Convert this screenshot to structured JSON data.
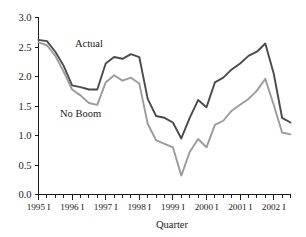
{
  "chart_data": {
    "type": "line",
    "title": "",
    "xlabel": "Quarter",
    "ylabel": "",
    "ylim": [
      0.0,
      3.0
    ],
    "ytick_values": [
      0.0,
      0.5,
      1.0,
      1.5,
      2.0,
      2.5,
      3.0
    ],
    "ytick_labels": [
      "0.0",
      "0.5",
      "1.0",
      "1.5",
      "2.0",
      "2.5",
      "3.0"
    ],
    "xtick_labels": [
      "1995 I",
      "1996 I",
      "1997 I",
      "1998 I",
      "1999 I",
      "2000 I",
      "2001 I",
      "2002 I"
    ],
    "x_minor_ticks_per_year": 4,
    "grid": false,
    "legend_position": "inline-annotation",
    "x": [
      "1995 I",
      "1995 II",
      "1995 III",
      "1995 IV",
      "1996 I",
      "1996 II",
      "1996 III",
      "1996 IV",
      "1997 I",
      "1997 II",
      "1997 III",
      "1997 IV",
      "1998 I",
      "1998 II",
      "1998 III",
      "1998 IV",
      "1999 I",
      "1999 II",
      "1999 III",
      "1999 IV",
      "2000 I",
      "2000 II",
      "2000 III",
      "2000 IV",
      "2001 I",
      "2001 II",
      "2001 III",
      "2001 IV",
      "2002 I",
      "2002 II",
      "2002 III"
    ],
    "series": [
      {
        "name": "Actual",
        "color": "#4a4a4a",
        "values": [
          2.62,
          2.6,
          2.42,
          2.18,
          1.85,
          1.82,
          1.78,
          1.78,
          2.22,
          2.33,
          2.3,
          2.38,
          2.33,
          1.62,
          1.33,
          1.3,
          1.22,
          0.95,
          1.3,
          1.6,
          1.48,
          1.9,
          1.98,
          2.12,
          2.22,
          2.35,
          2.42,
          2.56,
          2.05,
          1.3,
          1.22
        ]
      },
      {
        "name": "No Boom",
        "color": "#9b9b9b",
        "values": [
          2.58,
          2.53,
          2.35,
          2.08,
          1.78,
          1.68,
          1.55,
          1.52,
          1.9,
          2.02,
          1.93,
          1.98,
          1.88,
          1.2,
          0.92,
          0.86,
          0.8,
          0.32,
          0.72,
          0.94,
          0.8,
          1.18,
          1.25,
          1.42,
          1.52,
          1.62,
          1.76,
          1.96,
          1.52,
          1.05,
          1.02
        ]
      }
    ],
    "annotations": [
      {
        "text": "Actual",
        "near_x": "1996 III",
        "near_y": 2.5
      },
      {
        "text": "No Boom",
        "near_x": "1996 II",
        "near_y": 1.32
      }
    ],
    "final_converged_value": 0.56
  }
}
